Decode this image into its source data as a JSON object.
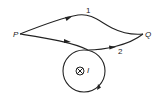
{
  "diagram": {
    "points": {
      "start": {
        "label": "P"
      },
      "end": {
        "label": "Q"
      }
    },
    "paths": [
      {
        "label": "1"
      },
      {
        "label": "2"
      }
    ],
    "current": {
      "label": "I",
      "symbol": "into-page"
    },
    "colors": {
      "stroke": "#222222",
      "background": "#ffffff"
    }
  }
}
